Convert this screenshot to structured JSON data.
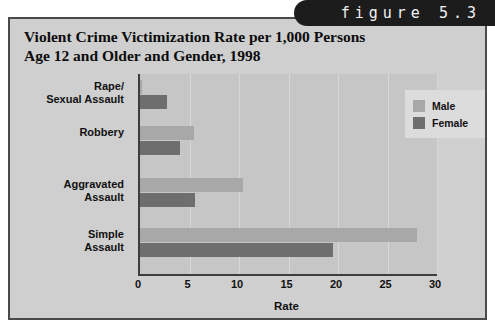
{
  "figure": {
    "tab_label": "figure 5.3",
    "tab_color": "#1c1c1c"
  },
  "panel": {
    "background": "#cfcfcf",
    "border_color": "#4a4a4a"
  },
  "chart_data": {
    "type": "bar",
    "orientation": "horizontal",
    "title": "Violent Crime Victimization Rate per 1,000 Persons\nAge 12 and Older and Gender, 1998",
    "categories": [
      "Rape/\nSexual Assault",
      "Robbery",
      "Aggravated\nAssault",
      "Simple\nAssault"
    ],
    "series": [
      {
        "name": "Male",
        "color": "#a8a8a8",
        "values": [
          0.2,
          5.5,
          10.4,
          28.0
        ]
      },
      {
        "name": "Female",
        "color": "#6e6e6e",
        "values": [
          2.7,
          4.0,
          5.6,
          19.5
        ]
      }
    ],
    "xlabel": "Rate",
    "ylabel": "",
    "xlim": [
      0,
      30
    ],
    "xticks": [
      0,
      5,
      10,
      15,
      20,
      25,
      30
    ],
    "xtick_labels": [
      "0",
      "5",
      "10",
      "15",
      "20",
      "25",
      "30"
    ],
    "grid": true,
    "legend_position": "top-right",
    "legend_entries": [
      "Male",
      "Female"
    ],
    "plot_background": "#c6c6c6",
    "axis_color": "#3d3d3d"
  }
}
